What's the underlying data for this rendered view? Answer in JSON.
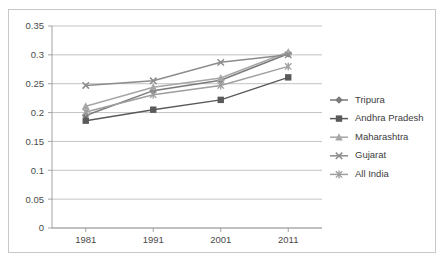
{
  "chart_data": {
    "type": "line",
    "title": "",
    "subtitle": "",
    "xlabel": "",
    "ylabel": "",
    "categories": [
      "1981",
      "1991",
      "2001",
      "2011"
    ],
    "x": [
      1981,
      1991,
      2001,
      2011
    ],
    "ylim": [
      0,
      0.35
    ],
    "yticks": [
      0,
      0.05,
      0.1,
      0.15,
      0.2,
      0.25,
      0.3,
      0.35
    ],
    "ytick_labels": [
      "0",
      "0.05",
      "0.1",
      "0.15",
      "0.2",
      "0.25",
      "0.3",
      "0.35"
    ],
    "xtick_labels": [
      "1981",
      "1991",
      "2001",
      "2011"
    ],
    "grid": "horizontal",
    "legend_position": "right",
    "series": [
      {
        "name": "Tripura",
        "marker": "diamond",
        "color": "#7a7a7a",
        "values": [
          0.195,
          0.238,
          0.256,
          0.302
        ]
      },
      {
        "name": "Andhra Pradesh",
        "marker": "square",
        "color": "#5a5a5a",
        "values": [
          0.186,
          0.205,
          0.222,
          0.261
        ]
      },
      {
        "name": "Maharashtra",
        "marker": "triangle",
        "color": "#a6a6a6",
        "values": [
          0.211,
          0.244,
          0.26,
          0.305
        ]
      },
      {
        "name": "Gujarat",
        "marker": "cross",
        "color": "#8c8c8c",
        "values": [
          0.247,
          0.255,
          0.287,
          0.3
        ]
      },
      {
        "name": "All India",
        "marker": "asterisk",
        "color": "#9e9e9e",
        "values": [
          0.201,
          0.231,
          0.247,
          0.28
        ]
      }
    ]
  },
  "legend": {
    "items": [
      {
        "label": "Tripura"
      },
      {
        "label": "Andhra Pradesh"
      },
      {
        "label": "Maharashtra"
      },
      {
        "label": "Gujarat"
      },
      {
        "label": "All India"
      }
    ]
  },
  "colors": {
    "frame": "#c8c8c8",
    "grid": "#b4b4b4",
    "axis": "#9a9a9a",
    "text": "#4a4a4a",
    "background": "#ffffff"
  }
}
